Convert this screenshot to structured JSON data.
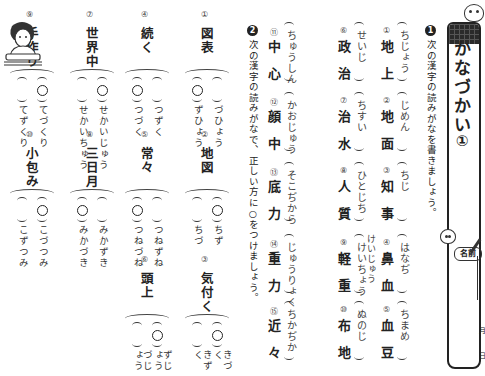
{
  "title": "かなづかい",
  "title_number": "①",
  "name_label": "名前",
  "date_labels": [
    "月",
    "日"
  ],
  "section1": {
    "badge": "1",
    "instruction": "次の漢字の読みがなを書きましょう。",
    "items": [
      {
        "num": "①",
        "kanji": "地上",
        "reading": "ちじょう"
      },
      {
        "num": "②",
        "kanji": "地面",
        "reading": "じめん"
      },
      {
        "num": "③",
        "kanji": "知事",
        "reading": "ちじ"
      },
      {
        "num": "④",
        "kanji": "鼻血",
        "reading": "はなぢ"
      },
      {
        "num": "⑤",
        "kanji": "血豆",
        "reading": "ちまめ"
      },
      {
        "num": "⑥",
        "kanji": "政治",
        "reading": "せいじ"
      },
      {
        "num": "⑦",
        "kanji": "治水",
        "reading": "ちすい"
      },
      {
        "num": "⑧",
        "kanji": "人質",
        "reading": "ひとじち"
      },
      {
        "num": "⑨",
        "kanji": "軽重",
        "reading": "けいちょう",
        "alt_reading": "けいじゅう"
      },
      {
        "num": "⑩",
        "kanji": "布地",
        "reading": "ぬのじ"
      },
      {
        "num": "⑪",
        "kanji": "中心",
        "reading": "ちゅうしん"
      },
      {
        "num": "⑫",
        "kanji": "顔中",
        "reading": "かおじゅう"
      },
      {
        "num": "⑬",
        "kanji": "底力",
        "reading": "そこぢから"
      },
      {
        "num": "⑭",
        "kanji": "重力",
        "reading": "じゅうりょく"
      },
      {
        "num": "⑮",
        "kanji": "近々",
        "reading": "ちかぢか"
      }
    ]
  },
  "section2": {
    "badge": "2",
    "instruction": "次の漢字の読みがなで、正しい方に○をつけましょう。",
    "mark": "○",
    "items": [
      {
        "num": "①",
        "kanji": "図表",
        "choices": [
          "づひょう",
          "ずひょう"
        ],
        "correct": 1
      },
      {
        "num": "②",
        "kanji": "地図",
        "choices": [
          "ちず",
          "ちづ"
        ],
        "correct": 0
      },
      {
        "num": "③",
        "kanji": "気付く",
        "choices": [
          "きづく",
          "きずく"
        ],
        "correct": 0
      },
      {
        "num": "④",
        "kanji": "続く",
        "choices": [
          "つずく",
          "つづく"
        ],
        "correct": 1
      },
      {
        "num": "⑤",
        "kanji": "常々",
        "choices": [
          "つねずね",
          "つねづね"
        ],
        "correct": 1
      },
      {
        "num": "⑥",
        "kanji": "頭上",
        "choices": [
          "ずじょう",
          "づじょう"
        ],
        "correct": 0
      },
      {
        "num": "⑦",
        "kanji": "世界中",
        "choices": [
          "せかいじゅう",
          "せかいちゅう"
        ],
        "correct": 0
      },
      {
        "num": "⑧",
        "kanji": "三日月",
        "choices": [
          "みかずき",
          "みかづき"
        ],
        "correct": 1
      },
      {
        "num": "⑨",
        "kanji": "手作り",
        "choices": [
          "てづくり",
          "てずくり"
        ],
        "correct": 0
      },
      {
        "num": "⑩",
        "kanji": "小包み",
        "choices": [
          "こづつみ",
          "こずつみ"
        ],
        "correct": 0
      }
    ]
  }
}
